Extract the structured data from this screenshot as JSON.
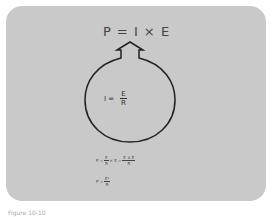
{
  "diagram": {
    "top_formula": "P = I × E",
    "inner_formula": {
      "lhs": "I =",
      "num": "E",
      "den": "R"
    },
    "derivation": {
      "prefix": "P =",
      "f1_num": "E",
      "f1_den": "R",
      "mid": "× E =",
      "f2_num": "E × E",
      "f2_den": "R"
    },
    "result": {
      "prefix": "P =",
      "num": "E²",
      "den": "R"
    }
  },
  "caption": "Figure 10-10"
}
